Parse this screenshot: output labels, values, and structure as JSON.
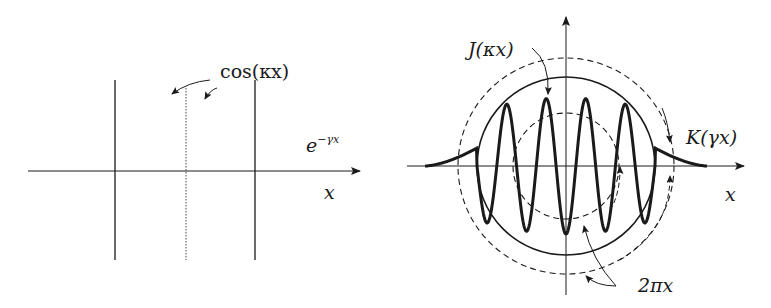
{
  "diagram": {
    "left_panel": {
      "labels": {
        "cos": "cos(κx)",
        "exp_base": "e",
        "exp_sup": "−γx",
        "x_axis": "x"
      },
      "description": "Damped oscillation: cos(κx) carrier inside exponential decay e^(−γx), with two vertical boundary lines and dotted center line"
    },
    "right_panel": {
      "labels": {
        "bessel_j": "J(κx)",
        "bessel_k": "K(γx)",
        "circumference": "2πx",
        "x_axis": "x"
      },
      "description": "Radial oscillation J(κx) inside circle, decaying tail K(γx) outside, with dashed circles of circumference 2πx"
    },
    "colors": {
      "stroke": "#1a1a1a",
      "background": "#ffffff"
    }
  }
}
